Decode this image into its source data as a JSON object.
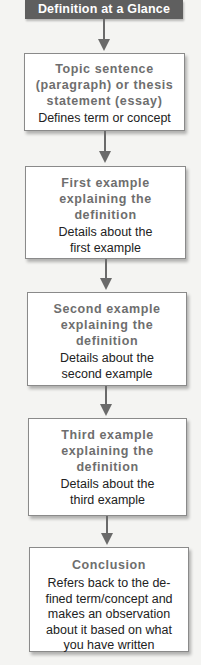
{
  "header": {
    "title": "Definition at a Glance"
  },
  "steps": [
    {
      "title_lines": [
        "Topic sentence",
        "(paragraph) or thesis",
        "statement (essay)"
      ],
      "desc_lines": [
        "Defines term or concept"
      ]
    },
    {
      "title_lines": [
        "First example",
        "explaining the",
        "definition"
      ],
      "desc_lines": [
        "Details about the",
        "first example"
      ]
    },
    {
      "title_lines": [
        "Second example",
        "explaining the",
        "definition"
      ],
      "desc_lines": [
        "Details about the",
        "second example"
      ]
    },
    {
      "title_lines": [
        "Third example",
        "explaining the",
        "definition"
      ],
      "desc_lines": [
        "Details about the",
        "third example"
      ]
    },
    {
      "title_lines": [
        "Conclusion"
      ],
      "desc_lines": [
        "Refers back to the de-",
        "fined term/concept and",
        "makes an observation",
        "about it based on what",
        "you have written"
      ]
    }
  ],
  "colors": {
    "header_bg": "#5f5f5f",
    "header_text": "#ffffff",
    "title_text": "#6e6e6e",
    "desc_text": "#222222",
    "arrow": "#6a6a6a",
    "box_border": "#8a8a8a"
  }
}
